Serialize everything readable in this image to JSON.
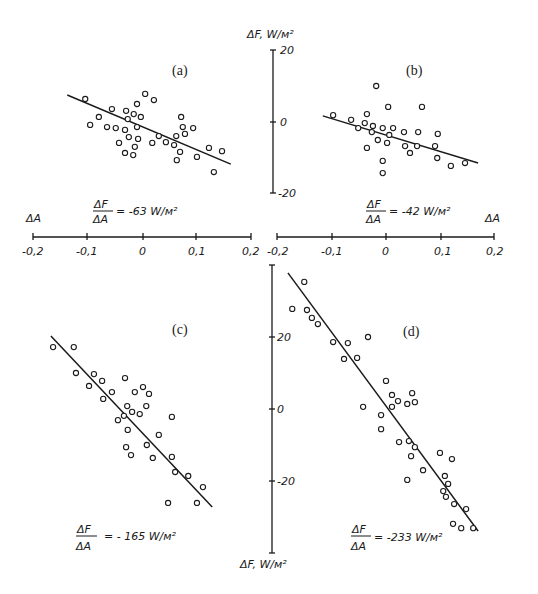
{
  "chart_data": [
    {
      "type": "scatter",
      "panel": "a",
      "title": "(a)",
      "xlabel": "ΔA",
      "ylabel": "ΔF, W/м²",
      "xlim": [
        -0.2,
        0.2
      ],
      "ylim": [
        -20,
        20
      ],
      "x_ticks": [
        "-0,2",
        "-0,1",
        "0",
        "0,1",
        "0,2"
      ],
      "y_ticks": [
        "20",
        "0",
        "-20"
      ],
      "annotation": {
        "num": "ΔF",
        "den": "ΔA",
        "value": "= -63 W/м²"
      },
      "slope": -63,
      "fit_line": {
        "x": [
          -0.139,
          0.161
        ],
        "y": [
          7.5,
          -11.7
        ]
      },
      "points": [
        [
          -0.106,
          6.4
        ],
        [
          -0.057,
          3.6
        ],
        [
          -0.081,
          1.4
        ],
        [
          -0.097,
          -0.8
        ],
        [
          -0.066,
          -1.4
        ],
        [
          -0.05,
          -1.7
        ],
        [
          -0.031,
          3.1
        ],
        [
          -0.011,
          5.0
        ],
        [
          0.004,
          7.8
        ],
        [
          0.02,
          6.1
        ],
        [
          -0.017,
          2.2
        ],
        [
          -0.004,
          1.4
        ],
        [
          -0.028,
          0.8
        ],
        [
          -0.033,
          -2.2
        ],
        [
          -0.011,
          -1.4
        ],
        [
          -0.026,
          -4.2
        ],
        [
          -0.009,
          -4.7
        ],
        [
          -0.044,
          -5.8
        ],
        [
          -0.015,
          -6.9
        ],
        [
          -0.033,
          -8.6
        ],
        [
          -0.018,
          -9.2
        ],
        [
          0.017,
          -5.8
        ],
        [
          0.029,
          -3.9
        ],
        [
          0.042,
          -5.6
        ],
        [
          0.057,
          -6.4
        ],
        [
          0.061,
          -3.9
        ],
        [
          0.07,
          1.4
        ],
        [
          0.073,
          -1.4
        ],
        [
          0.077,
          -3.3
        ],
        [
          0.092,
          -1.7
        ],
        [
          0.068,
          -8.3
        ],
        [
          0.062,
          -10.6
        ],
        [
          0.099,
          -9.7
        ],
        [
          0.121,
          -7.2
        ],
        [
          0.145,
          -8.1
        ],
        [
          0.13,
          -13.9
        ]
      ]
    },
    {
      "type": "scatter",
      "panel": "b",
      "title": "(b)",
      "xlabel": "ΔA",
      "ylabel": "ΔF, W/м²",
      "xlim": [
        -0.2,
        0.2
      ],
      "ylim": [
        -20,
        20
      ],
      "x_ticks": [
        "-0,2",
        "-0,1",
        "0",
        "0,1",
        "0,2"
      ],
      "y_ticks": [
        "20",
        "0",
        "-20"
      ],
      "annotation": {
        "num": "ΔF",
        "den": "ΔA",
        "value": "= -42 W/м²"
      },
      "slope": -42,
      "fit_line": {
        "x": [
          -0.116,
          0.169
        ],
        "y": [
          1.7,
          -11.4
        ]
      },
      "points": [
        [
          -0.097,
          1.9
        ],
        [
          -0.064,
          0.6
        ],
        [
          -0.051,
          -1.7
        ],
        [
          -0.035,
          2.2
        ],
        [
          -0.039,
          -0.3
        ],
        [
          -0.024,
          -1.1
        ],
        [
          -0.026,
          -2.8
        ],
        [
          -0.018,
          10.0
        ],
        [
          0.004,
          4.2
        ],
        [
          -0.006,
          -1.7
        ],
        [
          0.013,
          -1.7
        ],
        [
          0.006,
          -3.6
        ],
        [
          -0.015,
          -5.0
        ],
        [
          0.002,
          -5.8
        ],
        [
          -0.035,
          -7.2
        ],
        [
          -0.006,
          -10.8
        ],
        [
          -0.006,
          -14.2
        ],
        [
          0.033,
          -2.8
        ],
        [
          0.059,
          -2.8
        ],
        [
          0.066,
          4.2
        ],
        [
          0.035,
          -6.7
        ],
        [
          0.044,
          -8.6
        ],
        [
          0.057,
          -6.7
        ],
        [
          0.09,
          -6.7
        ],
        [
          0.095,
          -3.3
        ],
        [
          0.094,
          -10.0
        ],
        [
          0.119,
          -12.2
        ],
        [
          0.145,
          -11.4
        ]
      ]
    },
    {
      "type": "scatter",
      "panel": "c",
      "title": "(c)",
      "xlabel": "ΔA",
      "ylabel": "ΔF, W/м²",
      "xlim": [
        -0.2,
        0.2
      ],
      "ylim": [
        -40,
        40
      ],
      "x_ticks": [
        "-0,2",
        "-0,1",
        "0",
        "0,1",
        "0,2"
      ],
      "y_ticks": [
        "20",
        "0",
        "-20"
      ],
      "annotation": {
        "num": "ΔF",
        "den": "ΔA",
        "value": "= - 165 W/м²"
      },
      "slope": -165,
      "fit_line": {
        "x": [
          -0.169,
          0.127
        ],
        "y": [
          20.3,
          -27.2
        ]
      },
      "points": [
        [
          -0.165,
          17.2
        ],
        [
          -0.127,
          17.2
        ],
        [
          -0.123,
          10.0
        ],
        [
          -0.09,
          9.7
        ],
        [
          -0.075,
          7.8
        ],
        [
          -0.099,
          6.4
        ],
        [
          -0.057,
          4.7
        ],
        [
          -0.073,
          2.8
        ],
        [
          -0.033,
          8.6
        ],
        [
          0.0,
          6.1
        ],
        [
          -0.015,
          4.7
        ],
        [
          0.011,
          4.2
        ],
        [
          -0.029,
          0.8
        ],
        [
          0.006,
          0.8
        ],
        [
          -0.02,
          -0.8
        ],
        [
          -0.006,
          -1.4
        ],
        [
          -0.035,
          -1.9
        ],
        [
          -0.046,
          -3.1
        ],
        [
          0.053,
          -2.2
        ],
        [
          -0.028,
          -5.8
        ],
        [
          0.029,
          -7.2
        ],
        [
          0.007,
          -10.0
        ],
        [
          -0.031,
          -10.6
        ],
        [
          -0.022,
          -12.8
        ],
        [
          0.018,
          -13.6
        ],
        [
          0.053,
          -13.3
        ],
        [
          0.059,
          -17.5
        ],
        [
          0.083,
          -18.6
        ],
        [
          0.11,
          -21.7
        ],
        [
          0.046,
          -26.1
        ],
        [
          0.099,
          -26.1
        ]
      ]
    },
    {
      "type": "scatter",
      "panel": "d",
      "title": "(d)",
      "xlabel": "ΔA",
      "ylabel": "ΔF, W/м²",
      "xlim": [
        -0.2,
        0.2
      ],
      "ylim": [
        -40,
        40
      ],
      "x_ticks": [
        "-0,2",
        "-0,1",
        "0",
        "0,1",
        "0,2"
      ],
      "y_ticks": [
        "20",
        "0",
        "-20"
      ],
      "annotation": {
        "num": "ΔF",
        "den": "ΔA",
        "value": "= -233 W/м²"
      },
      "slope": -233,
      "fit_line": {
        "x": [
          -0.18,
          0.169
        ],
        "y": [
          37.8,
          -33.9
        ]
      },
      "points": [
        [
          -0.15,
          35.3
        ],
        [
          -0.172,
          27.8
        ],
        [
          -0.145,
          27.5
        ],
        [
          -0.136,
          25.3
        ],
        [
          -0.125,
          23.6
        ],
        [
          -0.097,
          18.6
        ],
        [
          -0.07,
          18.3
        ],
        [
          -0.033,
          20.0
        ],
        [
          -0.077,
          13.9
        ],
        [
          -0.053,
          14.2
        ],
        [
          0.0,
          7.8
        ],
        [
          0.011,
          3.9
        ],
        [
          0.048,
          4.4
        ],
        [
          0.022,
          2.2
        ],
        [
          0.039,
          1.4
        ],
        [
          0.053,
          1.9
        ],
        [
          0.011,
          0.6
        ],
        [
          -0.042,
          0.6
        ],
        [
          -0.009,
          -1.7
        ],
        [
          -0.009,
          -5.6
        ],
        [
          0.024,
          -9.2
        ],
        [
          0.042,
          -8.9
        ],
        [
          0.053,
          -10.6
        ],
        [
          0.046,
          -13.1
        ],
        [
          0.099,
          -12.2
        ],
        [
          0.121,
          -13.9
        ],
        [
          0.068,
          -17.0
        ],
        [
          0.039,
          -19.7
        ],
        [
          0.108,
          -18.6
        ],
        [
          0.114,
          -20.8
        ],
        [
          0.105,
          -22.8
        ],
        [
          0.11,
          -24.4
        ],
        [
          0.125,
          -26.4
        ],
        [
          0.147,
          -27.8
        ],
        [
          0.123,
          -31.9
        ],
        [
          0.138,
          -33.1
        ],
        [
          0.16,
          -33.1
        ]
      ]
    }
  ],
  "axes": {
    "top_y_label": "ΔF, W/м²",
    "bottom_y_label": "ΔF,  W/м²",
    "left_x_label": "ΔA",
    "right_x_label": "ΔA",
    "x_tick_labels": [
      "-0,2",
      "-0,1",
      "0",
      "0,1",
      "0,2"
    ],
    "top_y_tick_labels": [
      "20",
      "0",
      "-20"
    ],
    "bottom_y_tick_labels": [
      "20",
      "0",
      "-20"
    ]
  },
  "panels": {
    "a": {
      "label": "(a)",
      "ann_num": "ΔF",
      "ann_den": "ΔA",
      "ann_value": "= -63 W/м²"
    },
    "b": {
      "label": "(b)",
      "ann_num": "ΔF",
      "ann_den": "ΔA",
      "ann_value": "= -42 W/м²"
    },
    "c": {
      "label": "(c)",
      "ann_num": "ΔF",
      "ann_den": "ΔA",
      "ann_value": "= - 165  W/м²"
    },
    "d": {
      "label": "(d)",
      "ann_num": "ΔF",
      "ann_den": "ΔA",
      "ann_value": "= -233 W/м²"
    }
  }
}
